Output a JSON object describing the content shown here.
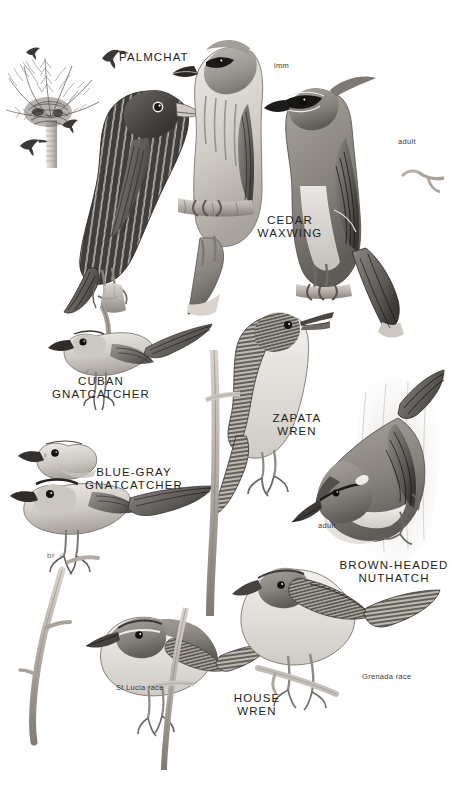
{
  "plate": {
    "type": "field-guide-illustration-plate",
    "background": "#ffffff",
    "ink": "#231f20",
    "medium": "graphite / grayscale bird illustration plate",
    "width": 469,
    "height": 794
  },
  "species_labels": [
    {
      "id": "palmchat",
      "text": "PALMCHAT",
      "x": 119,
      "y": 56,
      "align": "left"
    },
    {
      "id": "cedar-waxwing",
      "text": "CEDAR\nWAXWING",
      "x": 290,
      "y": 220,
      "align": "center"
    },
    {
      "id": "cuban-gnatcatcher",
      "text": "CUBAN\nGNATCATCHER",
      "x": 101,
      "y": 375,
      "align": "center"
    },
    {
      "id": "blue-gray-gnatcatcher",
      "text": "BLUE-GRAY\nGNATCATCHER",
      "x": 134,
      "y": 466,
      "align": "center"
    },
    {
      "id": "zapata-wren",
      "text": "ZAPATA\nWREN",
      "x": 297,
      "y": 418,
      "align": "center"
    },
    {
      "id": "brown-headed-nuthatch",
      "text": "BROWN-HEADED\nNUTHATCH",
      "x": 394,
      "y": 563,
      "align": "center"
    },
    {
      "id": "house-wren",
      "text": "HOUSE\nWREN",
      "x": 257,
      "y": 696,
      "align": "center"
    }
  ],
  "annotations": [
    {
      "id": "waxwing-imm",
      "text": "imm",
      "x": 274,
      "y": 62
    },
    {
      "id": "waxwing-adult",
      "text": "adult",
      "x": 398,
      "y": 138
    },
    {
      "id": "nuthatch-adult",
      "text": "adult",
      "x": 318,
      "y": 522
    },
    {
      "id": "wren-st-lucia",
      "text": "St Lucia race",
      "x": 116,
      "y": 684
    },
    {
      "id": "wren-grenada",
      "text": "Grenada race",
      "x": 362,
      "y": 673
    }
  ],
  "sex_symbols": [
    {
      "id": "cuban-gnatcatcher-male",
      "text": "♂",
      "x": 84,
      "y": 368
    },
    {
      "id": "blue-gray-gnatcatcher-female",
      "text": "♀",
      "x": 42,
      "y": 452
    },
    {
      "id": "blue-gray-gnatcatcher-br-male",
      "text": "br ♂",
      "x": 47,
      "y": 552
    }
  ],
  "figures": [
    {
      "id": "palm-tree-with-nest",
      "name": "royal palm with palmchat nest"
    },
    {
      "id": "flying-palmchat-silhouette-a",
      "name": "palmchat in flight"
    },
    {
      "id": "flying-palmchat-silhouette-b",
      "name": "palmchat in flight"
    },
    {
      "id": "flying-palmchat-silhouette-c",
      "name": "palmchat in flight"
    },
    {
      "id": "flying-palmchat-silhouette-d",
      "name": "palmchat in flight"
    },
    {
      "id": "palmchat-perched",
      "name": "palmchat perched on branch"
    },
    {
      "id": "cedar-waxwing-immature",
      "name": "cedar waxwing immature perched"
    },
    {
      "id": "cedar-waxwing-adult",
      "name": "cedar waxwing adult perched"
    },
    {
      "id": "cuban-gnatcatcher-male-fig",
      "name": "cuban gnatcatcher male perched"
    },
    {
      "id": "blue-gray-gnatcatcher-female-head",
      "name": "blue-gray gnatcatcher female head"
    },
    {
      "id": "blue-gray-gnatcatcher-male-fig",
      "name": "blue-gray gnatcatcher breeding male perched"
    },
    {
      "id": "zapata-wren-fig",
      "name": "zapata wren singing on stem"
    },
    {
      "id": "brown-headed-nuthatch-fig",
      "name": "brown-headed nuthatch on trunk"
    },
    {
      "id": "house-wren-st-lucia-fig",
      "name": "house wren st lucia race"
    },
    {
      "id": "house-wren-grenada-fig",
      "name": "house wren grenada race"
    },
    {
      "id": "bare-branch",
      "name": "bare branch perch"
    }
  ]
}
